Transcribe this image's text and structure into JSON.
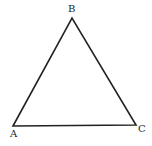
{
  "diagram": {
    "type": "triangle",
    "vertices": [
      {
        "label": "A",
        "x": 13,
        "y": 126
      },
      {
        "label": "B",
        "x": 72,
        "y": 18
      },
      {
        "label": "C",
        "x": 136,
        "y": 125
      }
    ],
    "stroke_color": "#222222"
  },
  "labels": {
    "a": "A",
    "b": "B",
    "c": "C"
  }
}
